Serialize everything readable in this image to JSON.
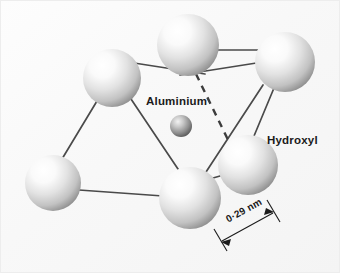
{
  "figure": {
    "kind": "molecular-structure-diagram",
    "background_color": "#fbfbfb",
    "border_color": "#ececec",
    "labels": {
      "aluminium": "Aluminium",
      "hydroxyl": "Hydroxyl",
      "distance": "0·29 nm"
    },
    "colors": {
      "hydroxyl_sphere_light": "#ffffff",
      "hydroxyl_sphere_mid": "#d9d9d9",
      "hydroxyl_sphere_dark": "#8e8e8e",
      "aluminium_sphere_light": "#f2f2f2",
      "aluminium_sphere_mid": "#9a9a9a",
      "aluminium_sphere_dark": "#4a4a4a",
      "bond_line": "#4a4a4a",
      "dashed_line": "#3c3c3c",
      "dimension_line": "#1b1b1b",
      "text": "#1b1b1b"
    },
    "atoms": [
      {
        "id": "oh-top",
        "species": "Hydroxyl",
        "cx": 188,
        "cy": 45,
        "r": 31
      },
      {
        "id": "oh-top-right",
        "species": "Hydroxyl",
        "cx": 285,
        "cy": 62,
        "r": 30
      },
      {
        "id": "oh-upper-left",
        "species": "Hydroxyl",
        "cx": 112,
        "cy": 78,
        "r": 29
      },
      {
        "id": "oh-right",
        "species": "Hydroxyl",
        "cx": 248,
        "cy": 165,
        "r": 30
      },
      {
        "id": "oh-bottom-left",
        "species": "Hydroxyl",
        "cx": 53,
        "cy": 183,
        "r": 28
      },
      {
        "id": "oh-bottom",
        "species": "Hydroxyl",
        "cx": 190,
        "cy": 198,
        "r": 31
      },
      {
        "id": "al-center",
        "species": "Aluminium",
        "cx": 181,
        "cy": 126,
        "r": 11
      }
    ],
    "bonds": [
      {
        "from": "oh-upper-left",
        "to": "oh-top",
        "x1": 134,
        "y1": 63,
        "x2": 205,
        "y2": 74
      },
      {
        "from": "oh-top",
        "to": "oh-top-right",
        "x1": 203,
        "y1": 50,
        "x2": 303,
        "y2": 50
      },
      {
        "from": "oh-top",
        "to": "oh-top-right",
        "x1": 180,
        "y1": 75,
        "x2": 301,
        "y2": 56
      },
      {
        "from": "oh-upper-left",
        "to": "oh-bottom-left",
        "x1": 97,
        "y1": 101,
        "x2": 62,
        "y2": 159
      },
      {
        "from": "oh-upper-left",
        "to": "oh-bottom",
        "x1": 131,
        "y1": 99,
        "x2": 180,
        "y2": 172
      },
      {
        "from": "oh-bottom-left",
        "to": "oh-bottom",
        "x1": 79,
        "y1": 190,
        "x2": 163,
        "y2": 196
      },
      {
        "from": "oh-top-right",
        "to": "oh-right",
        "x1": 274,
        "y1": 88,
        "x2": 254,
        "y2": 136
      },
      {
        "from": "oh-top-right",
        "to": "oh-bottom",
        "x1": 263,
        "y1": 85,
        "x2": 206,
        "y2": 172
      },
      {
        "from": "oh-right",
        "to": "oh-bottom",
        "x1": 220,
        "y1": 176,
        "x2": 199,
        "y2": 182
      }
    ],
    "dashed_bond": {
      "from": "oh-top",
      "to": "oh-right",
      "x1": 196,
      "y1": 74,
      "x2": 232,
      "y2": 148
    },
    "dimension": {
      "value": "0·29 nm",
      "line": {
        "x1": 221,
        "y1": 242,
        "x2": 274,
        "y2": 213
      },
      "tick_left": {
        "x1": 214,
        "y1": 228,
        "x2": 226,
        "y2": 250
      },
      "tick_right": {
        "x1": 268,
        "y1": 199,
        "x2": 280,
        "y2": 221
      }
    }
  }
}
